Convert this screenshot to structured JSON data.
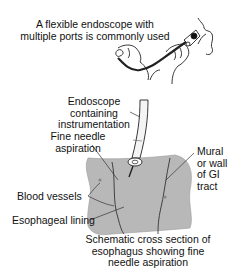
{
  "diagram": {
    "top_caption": [
      "A flexible endoscope with",
      "multiple ports is commonly used"
    ],
    "labels": {
      "endoscope": [
        "Endoscope",
        "containing",
        "instrumentation"
      ],
      "fna": [
        "Fine needle",
        "aspiration"
      ],
      "mural": [
        "Mural",
        "or wall",
        "of GI",
        "tract"
      ],
      "blood_vessels": "Blood vessels",
      "lining": "Esophageal lining"
    },
    "bottom_caption": [
      "Schematic cross section of",
      "esophagus showing fine",
      "needle aspiration"
    ],
    "colors": {
      "tissue": "#b5b5b5",
      "tissue_dark": "#8e8e8e",
      "line": "#222222",
      "scope_fill": "#f2f2f2"
    }
  }
}
